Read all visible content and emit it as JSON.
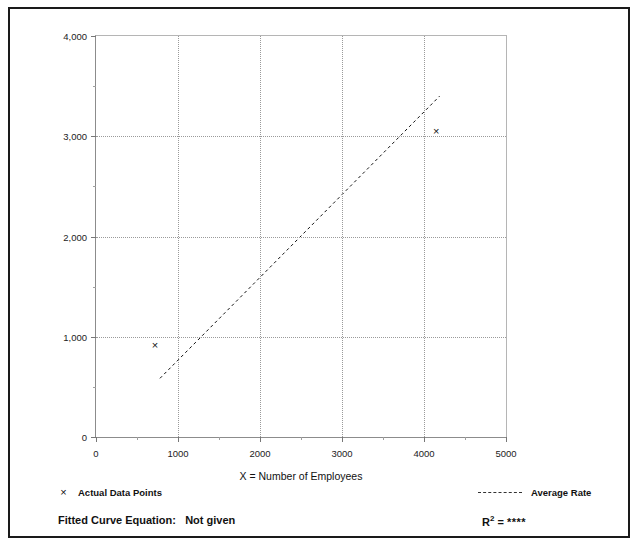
{
  "figure": {
    "cut_text_left": "",
    "cut_text_right": ""
  },
  "chart_data": {
    "type": "scatter",
    "title": "",
    "xlabel": "X = Number of Employees",
    "ylabel": "T = Average Vehicle Trip Ends",
    "xlim": [
      0,
      5000
    ],
    "ylim": [
      0,
      4000
    ],
    "xticks": [
      0,
      1000,
      2000,
      3000,
      4000,
      5000
    ],
    "yticks": [
      0,
      1000,
      2000,
      3000,
      4000
    ],
    "xtick_labels": [
      "0",
      "1000",
      "2000",
      "3000",
      "4000",
      "5000"
    ],
    "ytick_labels": [
      "0",
      "1,000",
      "2,000",
      "3,000",
      "4,000"
    ],
    "minor_tick_step_x": 500,
    "minor_tick_step_y": 500,
    "grid": true,
    "grid_style": "dotted",
    "legend_position": "below-plot",
    "series": [
      {
        "name": "Actual Data Points",
        "type": "scatter",
        "marker": "x",
        "points": [
          {
            "x": 720,
            "y": 920
          },
          {
            "x": 4150,
            "y": 3055
          }
        ]
      },
      {
        "name": "Average Rate",
        "type": "line",
        "style": "dashed",
        "points": [
          {
            "x": 780,
            "y": 585
          },
          {
            "x": 4190,
            "y": 3400
          }
        ]
      }
    ]
  },
  "legend": {
    "actual_points_label": "Actual Data Points",
    "average_rate_label": "Average Rate",
    "marker_glyph": "×"
  },
  "footer": {
    "fitted_curve_label": "Fitted Curve Equation:",
    "fitted_curve_value": "Not given",
    "r2_label": "R",
    "r2_exponent": "2",
    "r2_equals": "=",
    "r2_value": "****"
  },
  "colors": {
    "ink": "#111111",
    "grid": "#9a9a9a",
    "axis": "#8c8c8c",
    "frame": "#1a1a1a",
    "background": "#ffffff"
  }
}
